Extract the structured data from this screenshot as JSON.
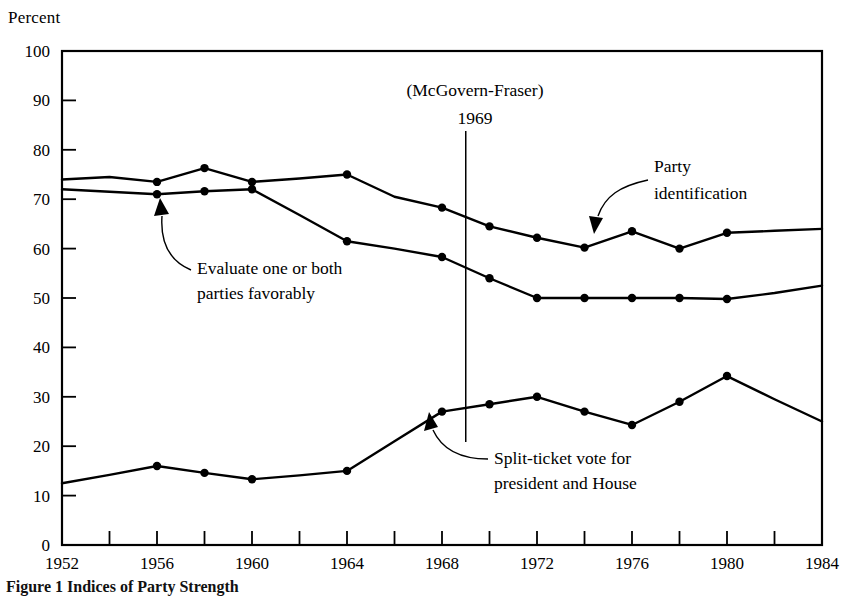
{
  "figure": {
    "y_axis_title": "Percent",
    "caption": "Figure 1   Indices of Party Strength"
  },
  "chart_data": {
    "type": "line",
    "title": "",
    "xlabel": "",
    "ylabel": "Percent",
    "xlim": [
      1952,
      1984
    ],
    "ylim": [
      0,
      100
    ],
    "grid": false,
    "legend_position": "inline-annotations",
    "y_ticks": [
      0,
      10,
      20,
      30,
      40,
      50,
      60,
      70,
      80,
      90,
      100
    ],
    "y_tick_labels": [
      "0",
      "10",
      "20",
      "30",
      "40",
      "50",
      "60",
      "70",
      "80",
      "90",
      "100"
    ],
    "x_ticks": [
      1952,
      1954,
      1956,
      1958,
      1960,
      1962,
      1964,
      1966,
      1968,
      1970,
      1972,
      1974,
      1976,
      1978,
      1980,
      1982,
      1984
    ],
    "x_tick_labels": [
      "1952",
      "",
      "1956",
      "",
      "1960",
      "",
      "1964",
      "",
      "1968",
      "",
      "1972",
      "",
      "1976",
      "",
      "1980",
      "",
      "1984"
    ],
    "series": [
      {
        "name": "Party identification",
        "x": [
          1952,
          1954,
          1956,
          1958,
          1960,
          1962,
          1964,
          1966,
          1968,
          1970,
          1972,
          1974,
          1976,
          1978,
          1980,
          1982,
          1984
        ],
        "values": [
          74,
          74.5,
          73.5,
          76.3,
          73.5,
          74.2,
          75,
          70.5,
          68.3,
          64.5,
          62.2,
          60.2,
          63.5,
          60,
          63.2,
          63.6,
          64
        ]
      },
      {
        "name": "Evaluate one or both parties favorably",
        "x": [
          1952,
          1954,
          1956,
          1958,
          1960,
          1962,
          1964,
          1966,
          1968,
          1970,
          1972,
          1974,
          1976,
          1978,
          1980,
          1982,
          1984
        ],
        "values": [
          72,
          71.5,
          71,
          71.6,
          72,
          66.8,
          61.5,
          60,
          58.3,
          54,
          50,
          50,
          50,
          50,
          49.8,
          51,
          52.5
        ]
      },
      {
        "name": "Split-ticket vote for president and House",
        "x": [
          1952,
          1954,
          1956,
          1958,
          1960,
          1962,
          1964,
          1966,
          1968,
          1970,
          1972,
          1974,
          1976,
          1978,
          1980,
          1982,
          1984
        ],
        "values": [
          12.5,
          14.2,
          16,
          14.6,
          13.3,
          14.1,
          15,
          21,
          27,
          28.5,
          30,
          27,
          24.3,
          29,
          34.2,
          29.5,
          25
        ]
      }
    ],
    "annotations": [
      {
        "id": "mcgovern-fraser",
        "line1": "(McGovern-Fraser)",
        "line2": "1969",
        "x_value": 1969,
        "marks_vertical_rule": true
      },
      {
        "id": "party-identification-label",
        "line1": "Party",
        "line2": "identification",
        "points_to_x": 1974,
        "points_to_y": 60.2
      },
      {
        "id": "evaluate-parties-label",
        "line1": "Evaluate one or both",
        "line2": "parties favorably",
        "points_to_x": 1958,
        "points_to_y": 71.6
      },
      {
        "id": "split-ticket-label",
        "line1": "Split-ticket vote for",
        "line2": "president and House",
        "points_to_x": 1967,
        "points_to_y": 24
      }
    ]
  }
}
